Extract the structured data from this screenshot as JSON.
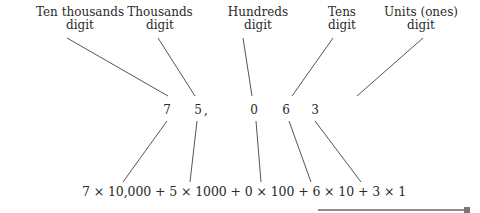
{
  "labels": [
    {
      "line1": "Ten thousands",
      "line2": "digit"
    },
    {
      "line1": "Thousands",
      "line2": "digit"
    },
    {
      "line1": "Hundreds",
      "line2": "digit"
    },
    {
      "line1": "Tens",
      "line2": "digit"
    },
    {
      "line1": "Units (ones)",
      "line2": "digit"
    }
  ],
  "number": {
    "digits": [
      "7",
      "5",
      "0",
      "6",
      "3"
    ],
    "separator": ","
  },
  "expansion": "7 × 10,000 + 5 × 1000 + 0 × 100 + 6 × 10 + 3 × 1",
  "colors": {
    "ink": "#2a2a2a",
    "line": "#555555",
    "marker": "#666666"
  }
}
